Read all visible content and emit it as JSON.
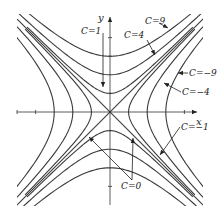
{
  "diagram": {
    "type": "level-curves",
    "function": "f(x, y) = y^2 - x^2",
    "axes": {
      "x_label": "x",
      "y_label": "y",
      "range": [
        -5,
        5
      ],
      "ticks": [
        -5,
        -4,
        4
      ],
      "y_ticks": [
        -4,
        3,
        4
      ]
    },
    "level_values": [
      9,
      4,
      1,
      0,
      -1,
      -4,
      -9
    ],
    "labels": [
      {
        "id": "c9",
        "text": "C=9",
        "level": 9
      },
      {
        "id": "c4",
        "text": "C=4",
        "level": 4
      },
      {
        "id": "c1",
        "text": "C=1",
        "level": 1
      },
      {
        "id": "cm9",
        "text": "C=−9",
        "level": -9
      },
      {
        "id": "cm4",
        "text": "C=−4",
        "level": -4
      },
      {
        "id": "cm1",
        "text": "C=−1",
        "level": -1
      },
      {
        "id": "c0",
        "text": "C=0",
        "level": 0
      }
    ],
    "colors": {
      "curve": "#3a3a3a",
      "text": "#222222",
      "background": "#ffffff"
    }
  }
}
